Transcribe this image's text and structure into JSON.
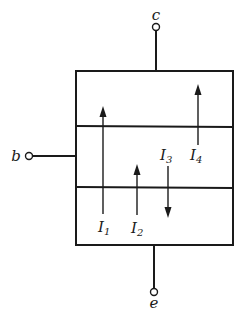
{
  "diagram": {
    "terminals": {
      "collector": {
        "label": "c"
      },
      "base": {
        "label": "b"
      },
      "emitter": {
        "label": "e"
      }
    },
    "layers": 3,
    "currents": [
      {
        "symbol": "I",
        "subscript": "1",
        "direction": "up"
      },
      {
        "symbol": "I",
        "subscript": "2",
        "direction": "up"
      },
      {
        "symbol": "I",
        "subscript": "3",
        "direction": "down"
      },
      {
        "symbol": "I",
        "subscript": "4",
        "direction": "up"
      }
    ]
  }
}
